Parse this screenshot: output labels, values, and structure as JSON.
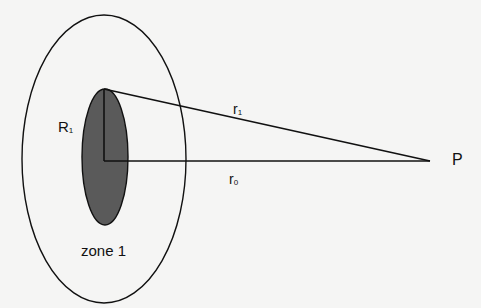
{
  "diagram": {
    "labels": {
      "R1_main": "R",
      "R1_sub": "1",
      "r1_main": "r",
      "r1_sub": "1",
      "r0_main": "r",
      "r0_sub": "0",
      "P": "P",
      "zone": "zone 1"
    },
    "colors": {
      "stroke": "#111111",
      "inner_fill": "#5a5a5a",
      "background": "#f5f5f4"
    }
  }
}
